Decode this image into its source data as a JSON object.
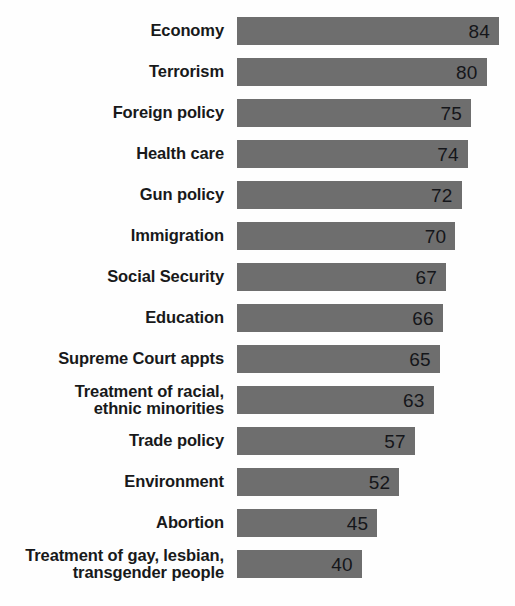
{
  "chart_data": {
    "type": "bar",
    "orientation": "horizontal",
    "title": "",
    "subtitle": "",
    "xlabel": "",
    "ylabel": "",
    "xlim": [
      0,
      84
    ],
    "grid": false,
    "legend": null,
    "value_suffix": "",
    "bar_color": "#6e6e6e",
    "label_color": "#18191a",
    "background_color": "#fefefe",
    "categories": [
      "Economy",
      "Terrorism",
      "Foreign policy",
      "Health care",
      "Gun policy",
      "Immigration",
      "Social Security",
      "Education",
      "Supreme Court appts",
      "Treatment of racial,\nethnic minorities",
      "Trade policy",
      "Environment",
      "Abortion",
      "Treatment of gay, lesbian,\ntransgender people"
    ],
    "values": [
      84,
      80,
      75,
      74,
      72,
      70,
      67,
      66,
      65,
      63,
      57,
      52,
      45,
      40
    ]
  }
}
